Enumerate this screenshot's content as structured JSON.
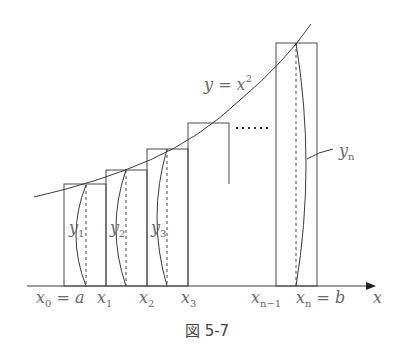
{
  "figure": {
    "caption": "図 5-7",
    "curve_label": {
      "main": "y = x",
      "sup": "2"
    },
    "axis_label": "x",
    "ellipsis": "……",
    "x_labels": [
      {
        "main": "x",
        "sub": "0",
        "suffix": " = a"
      },
      {
        "main": "x",
        "sub": "1",
        "suffix": ""
      },
      {
        "main": "x",
        "sub": "2",
        "suffix": ""
      },
      {
        "main": "x",
        "sub": "3",
        "suffix": ""
      },
      {
        "main": "x",
        "sub": "n−1",
        "suffix": ""
      },
      {
        "main": "x",
        "sub": "n",
        "suffix": " = b"
      }
    ],
    "y_labels": [
      {
        "main": "y",
        "sub": "1"
      },
      {
        "main": "y",
        "sub": "2"
      },
      {
        "main": "y",
        "sub": "3"
      },
      {
        "main": "y",
        "sub": "n"
      }
    ]
  }
}
